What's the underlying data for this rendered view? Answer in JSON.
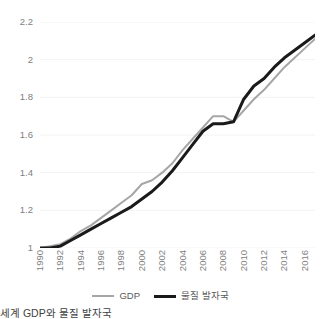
{
  "caption": "세계 GDP와 물질 발자국",
  "legend": {
    "position": "bottom-center",
    "entries": [
      {
        "label": "GDP",
        "color": "#a6a6a6",
        "swatch": "line-swatch-gdp"
      },
      {
        "label": "물질 발자국",
        "color": "#1a1a1a",
        "swatch": "line-swatch-material-footprint"
      }
    ]
  },
  "chart_data": {
    "type": "line",
    "title": "세계 GDP와 물질 발자국",
    "xlabel": "",
    "ylabel": "",
    "xlim": [
      1990,
      2017
    ],
    "ylim": [
      1,
      2.2
    ],
    "grid": true,
    "grid_axis": "y",
    "grid_color": "#f2f2f2",
    "legend_position": "bottom-center",
    "y_ticks": [
      "1",
      "1.2",
      "1.4",
      "1.6",
      "1.8",
      "2",
      "2.2"
    ],
    "y_tick_values": [
      1,
      1.2,
      1.4,
      1.6,
      1.8,
      2,
      2.2
    ],
    "x_ticks": [
      "1990",
      "1992",
      "1994",
      "1996",
      "1998",
      "2000",
      "2002",
      "2004",
      "2006",
      "2008",
      "2010",
      "2012",
      "2014",
      "2016"
    ],
    "x_tick_values": [
      1990,
      1992,
      1994,
      1996,
      1998,
      2000,
      2002,
      2004,
      2006,
      2008,
      2010,
      2012,
      2014,
      2016
    ],
    "x": [
      1990,
      1991,
      1992,
      1993,
      1994,
      1995,
      1996,
      1997,
      1998,
      1999,
      2000,
      2001,
      2002,
      2003,
      2004,
      2005,
      2006,
      2007,
      2008,
      2009,
      2010,
      2011,
      2012,
      2013,
      2014,
      2015,
      2016,
      2017
    ],
    "series": [
      {
        "name": "GDP",
        "color": "#a6a6a6",
        "width": 2,
        "values": [
          1.0,
          1.01,
          1.02,
          1.05,
          1.09,
          1.12,
          1.16,
          1.2,
          1.24,
          1.28,
          1.34,
          1.36,
          1.4,
          1.45,
          1.52,
          1.58,
          1.64,
          1.7,
          1.7,
          1.67,
          1.73,
          1.79,
          1.84,
          1.9,
          1.96,
          2.01,
          2.06,
          2.11
        ]
      },
      {
        "name": "물질 발자국",
        "color": "#1a1a1a",
        "width": 3,
        "values": [
          1.0,
          1.0,
          1.01,
          1.04,
          1.07,
          1.1,
          1.13,
          1.16,
          1.19,
          1.22,
          1.26,
          1.3,
          1.35,
          1.41,
          1.48,
          1.55,
          1.62,
          1.66,
          1.66,
          1.67,
          1.79,
          1.86,
          1.9,
          1.96,
          2.01,
          2.05,
          2.09,
          2.13
        ]
      }
    ]
  }
}
